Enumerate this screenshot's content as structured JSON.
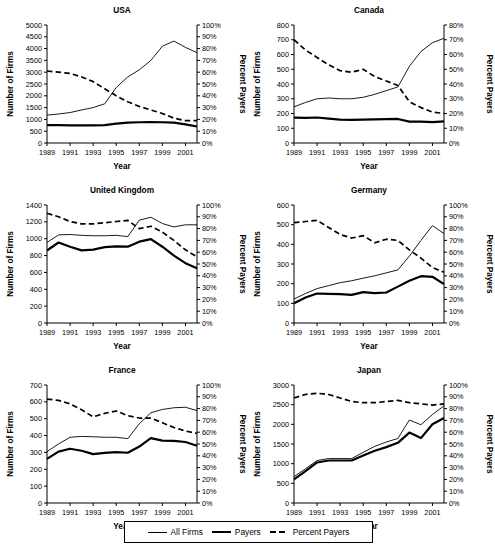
{
  "figure": {
    "axis_x_label": "Year",
    "axis_y_left_label": "Number of Firms",
    "axis_y_right_label": "Percent Payers"
  },
  "legend": {
    "items": [
      {
        "label": "All Firms",
        "style": "thin-solid"
      },
      {
        "label": "Payers",
        "style": "thick-solid"
      },
      {
        "label": "Percent Payers",
        "style": "dashed"
      }
    ]
  },
  "chart_data": [
    {
      "type": "line",
      "title": "USA",
      "xlabel": "Year",
      "ylabel": "Number of Firms",
      "y2label": "Percent Payers",
      "grid": false,
      "legend_position": "bottom-figure",
      "x": [
        1989,
        1990,
        1991,
        1992,
        1993,
        1994,
        1995,
        1996,
        1997,
        1998,
        1999,
        2000,
        2001,
        2002
      ],
      "xticklabels": [
        "1989",
        "1991",
        "1993",
        "1995",
        "1997",
        "1999",
        "2001"
      ],
      "ylim": [
        0,
        5000
      ],
      "yticks": [
        0,
        500,
        1000,
        1500,
        2000,
        2500,
        3000,
        3500,
        4000,
        4500,
        5000
      ],
      "y2lim": [
        0,
        100
      ],
      "y2ticks": [
        0,
        10,
        20,
        30,
        40,
        50,
        60,
        70,
        80,
        90,
        100
      ],
      "y2ticklabels": [
        "0%",
        "10%",
        "20%",
        "30%",
        "40%",
        "50%",
        "60%",
        "70%",
        "80%",
        "90%",
        "100%"
      ],
      "series": [
        {
          "name": "All Firms",
          "axis": "left",
          "values": [
            1180,
            1230,
            1290,
            1400,
            1500,
            1660,
            2350,
            2800,
            3100,
            3500,
            4100,
            4320,
            4050,
            3830
          ]
        },
        {
          "name": "Payers",
          "axis": "left",
          "values": [
            760,
            755,
            750,
            748,
            745,
            760,
            820,
            860,
            880,
            885,
            880,
            860,
            790,
            700
          ]
        },
        {
          "name": "Percent Payers",
          "axis": "right",
          "values": [
            61,
            60,
            59,
            56,
            52,
            46,
            40,
            35,
            31,
            28,
            25,
            21,
            19,
            19
          ]
        }
      ]
    },
    {
      "type": "line",
      "title": "Canada",
      "xlabel": "Year",
      "ylabel": "Number of Firms",
      "y2label": "Percent Payers",
      "grid": false,
      "legend_position": "bottom-figure",
      "x": [
        1989,
        1990,
        1991,
        1992,
        1993,
        1994,
        1995,
        1996,
        1997,
        1998,
        1999,
        2000,
        2001,
        2002
      ],
      "xticklabels": [
        "1989",
        "1991",
        "1993",
        "1995",
        "1997",
        "1999",
        "2001"
      ],
      "ylim": [
        0,
        800
      ],
      "yticks": [
        0,
        100,
        200,
        300,
        400,
        500,
        600,
        700,
        800
      ],
      "y2lim": [
        0,
        80
      ],
      "y2ticks": [
        0,
        10,
        20,
        30,
        40,
        50,
        60,
        70,
        80
      ],
      "y2ticklabels": [
        "0%",
        "10%",
        "20%",
        "30%",
        "40%",
        "50%",
        "60%",
        "70%",
        "80%"
      ],
      "series": [
        {
          "name": "All Firms",
          "axis": "left",
          "values": [
            245,
            275,
            300,
            305,
            300,
            300,
            310,
            330,
            355,
            380,
            520,
            620,
            680,
            710
          ]
        },
        {
          "name": "Payers",
          "axis": "left",
          "values": [
            172,
            170,
            173,
            165,
            158,
            157,
            158,
            160,
            162,
            163,
            145,
            145,
            142,
            146
          ]
        },
        {
          "name": "Percent Payers",
          "axis": "right",
          "values": [
            70,
            63,
            58,
            53,
            49,
            48,
            50,
            45,
            42,
            39,
            28,
            24,
            21,
            20
          ]
        }
      ]
    },
    {
      "type": "line",
      "title": "United Kingdom",
      "xlabel": "Year",
      "ylabel": "Number of Firms",
      "y2label": "Percent Payers",
      "grid": false,
      "legend_position": "bottom-figure",
      "x": [
        1989,
        1990,
        1991,
        1992,
        1993,
        1994,
        1995,
        1996,
        1997,
        1998,
        1999,
        2000,
        2001,
        2002
      ],
      "xticklabels": [
        "1989",
        "1991",
        "1993",
        "1995",
        "1997",
        "1999",
        "2001"
      ],
      "ylim": [
        0,
        1400
      ],
      "yticks": [
        0,
        200,
        400,
        600,
        800,
        1000,
        1200,
        1400
      ],
      "y2lim": [
        0,
        100
      ],
      "y2ticks": [
        0,
        10,
        20,
        30,
        40,
        50,
        60,
        70,
        80,
        90,
        100
      ],
      "y2ticklabels": [
        "0%",
        "10%",
        "20%",
        "30%",
        "40%",
        "50%",
        "60%",
        "70%",
        "80%",
        "90%",
        "100%"
      ],
      "series": [
        {
          "name": "All Firms",
          "axis": "left",
          "values": [
            955,
            1045,
            1050,
            1040,
            1035,
            1035,
            1040,
            1025,
            1220,
            1255,
            1180,
            1140,
            1165,
            1165
          ]
        },
        {
          "name": "Payers",
          "axis": "left",
          "values": [
            860,
            955,
            905,
            862,
            870,
            900,
            910,
            905,
            965,
            995,
            905,
            800,
            710,
            650
          ]
        },
        {
          "name": "Percent Payers",
          "axis": "right",
          "values": [
            93,
            90,
            86,
            84,
            84,
            85,
            86,
            87,
            80,
            82,
            77,
            70,
            62,
            56
          ]
        }
      ]
    },
    {
      "type": "line",
      "title": "Germany",
      "xlabel": "Year",
      "ylabel": "Number of Firms",
      "y2label": "Percent Payers",
      "grid": false,
      "legend_position": "bottom-figure",
      "x": [
        1989,
        1990,
        1991,
        1992,
        1993,
        1994,
        1995,
        1996,
        1997,
        1998,
        1999,
        2000,
        2001,
        2002
      ],
      "xticklabels": [
        "1989",
        "1991",
        "1993",
        "1995",
        "1997",
        "1999",
        "2001"
      ],
      "ylim": [
        0,
        600
      ],
      "yticks": [
        0,
        100,
        200,
        300,
        400,
        500,
        600
      ],
      "y2lim": [
        0,
        100
      ],
      "y2ticks": [
        0,
        10,
        20,
        30,
        40,
        50,
        60,
        70,
        80,
        90,
        100
      ],
      "y2ticklabels": [
        "0%",
        "10%",
        "20%",
        "30%",
        "40%",
        "50%",
        "60%",
        "70%",
        "80%",
        "90%",
        "100%"
      ],
      "series": [
        {
          "name": "All Firms",
          "axis": "left",
          "values": [
            122,
            150,
            175,
            190,
            205,
            215,
            228,
            240,
            255,
            270,
            340,
            420,
            495,
            455
          ]
        },
        {
          "name": "Payers",
          "axis": "left",
          "values": [
            100,
            130,
            150,
            148,
            147,
            143,
            157,
            152,
            155,
            185,
            215,
            238,
            235,
            198
          ]
        },
        {
          "name": "Percent Payers",
          "axis": "right",
          "values": [
            85,
            86,
            87,
            81,
            75,
            72,
            74,
            68,
            71,
            70,
            62,
            55,
            47,
            43
          ]
        }
      ]
    },
    {
      "type": "line",
      "title": "France",
      "xlabel": "Year",
      "ylabel": "Number of Firms",
      "y2label": "Percent Payers",
      "grid": false,
      "legend_position": "bottom-figure",
      "x": [
        1989,
        1990,
        1991,
        1992,
        1993,
        1994,
        1995,
        1996,
        1997,
        1998,
        1999,
        2000,
        2001,
        2002
      ],
      "xticklabels": [
        "1989",
        "1991",
        "1993",
        "1995",
        "1997",
        "1999",
        "2001"
      ],
      "ylim": [
        0,
        700
      ],
      "yticks": [
        0,
        100,
        200,
        300,
        400,
        500,
        600,
        700
      ],
      "y2lim": [
        0,
        100
      ],
      "y2ticks": [
        0,
        10,
        20,
        30,
        40,
        50,
        60,
        70,
        80,
        90,
        100
      ],
      "y2ticklabels": [
        "0%",
        "10%",
        "20%",
        "30%",
        "40%",
        "50%",
        "60%",
        "70%",
        "80%",
        "90%",
        "100%"
      ],
      "series": [
        {
          "name": "All Firms",
          "axis": "left",
          "values": [
            305,
            350,
            390,
            395,
            393,
            390,
            390,
            382,
            470,
            535,
            555,
            565,
            568,
            548
          ]
        },
        {
          "name": "Payers",
          "axis": "left",
          "values": [
            262,
            305,
            322,
            310,
            290,
            297,
            302,
            298,
            335,
            385,
            370,
            368,
            362,
            340
          ]
        },
        {
          "name": "Percent Payers",
          "axis": "right",
          "values": [
            88,
            87,
            84,
            79,
            73,
            76,
            78,
            74,
            72,
            72,
            68,
            64,
            61,
            59
          ]
        }
      ]
    },
    {
      "type": "line",
      "title": "Japan",
      "xlabel": "Year",
      "ylabel": "Number of Firms",
      "y2label": "Percent Payers",
      "grid": false,
      "legend_position": "bottom-figure",
      "x": [
        1989,
        1990,
        1991,
        1992,
        1993,
        1994,
        1995,
        1996,
        1997,
        1998,
        1999,
        2000,
        2001,
        2002
      ],
      "xticklabels": [
        "1989",
        "1991",
        "1993",
        "1995",
        "1997",
        "1999",
        "2001"
      ],
      "ylim": [
        0,
        3000
      ],
      "yticks": [
        0,
        500,
        1000,
        1500,
        2000,
        2500,
        3000
      ],
      "y2lim": [
        0,
        100
      ],
      "y2ticks": [
        0,
        10,
        20,
        30,
        40,
        50,
        60,
        70,
        80,
        90,
        100
      ],
      "y2ticklabels": [
        "0%",
        "10%",
        "20%",
        "30%",
        "40%",
        "50%",
        "60%",
        "70%",
        "80%",
        "90%",
        "100%"
      ],
      "series": [
        {
          "name": "All Firms",
          "axis": "left",
          "values": [
            670,
            870,
            1080,
            1130,
            1130,
            1130,
            1290,
            1440,
            1550,
            1640,
            2110,
            1990,
            2250,
            2470
          ]
        },
        {
          "name": "Payers",
          "axis": "left",
          "values": [
            600,
            810,
            1030,
            1080,
            1080,
            1080,
            1210,
            1330,
            1420,
            1530,
            1790,
            1650,
            2000,
            2160
          ]
        },
        {
          "name": "Percent Payers",
          "axis": "right",
          "values": [
            89,
            92,
            93,
            92,
            89,
            86,
            85,
            85,
            86,
            87,
            85,
            84,
            83,
            84
          ]
        }
      ]
    }
  ]
}
